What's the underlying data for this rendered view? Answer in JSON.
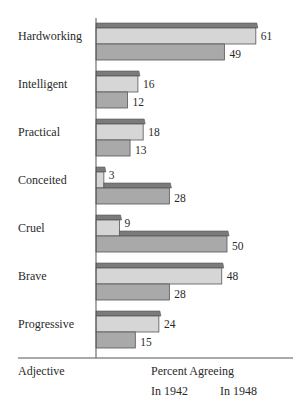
{
  "chart_data": {
    "type": "bar",
    "orientation": "horizontal",
    "title": "",
    "xlabel": "Percent Agreeing",
    "ylabel": "Adjective",
    "categories": [
      "Hardworking",
      "Intelligent",
      "Practical",
      "Conceited",
      "Cruel",
      "Brave",
      "Progressive"
    ],
    "series": [
      {
        "name": "In 1942",
        "values": [
          61,
          16,
          18,
          3,
          9,
          48,
          24
        ],
        "color": "#d6d6d6"
      },
      {
        "name": "In 1948",
        "values": [
          49,
          12,
          13,
          28,
          50,
          28,
          15
        ],
        "color": "#a9a9a9"
      }
    ],
    "xlim": [
      0,
      70
    ],
    "grid": false,
    "legend": {
      "position": "bottom",
      "entries": [
        "In 1942",
        "In 1948"
      ]
    },
    "data_labels": true
  },
  "labels": {
    "axis_left": "Adjective",
    "axis_bottom": "Percent Agreeing",
    "legend_1942": "In 1942",
    "legend_1948": "In 1948"
  },
  "colors": {
    "bar_1942": "#d6d6d6",
    "bar_1948": "#a9a9a9",
    "cap": "#7b7b7b",
    "outline": "#555555",
    "axis": "#555555"
  }
}
